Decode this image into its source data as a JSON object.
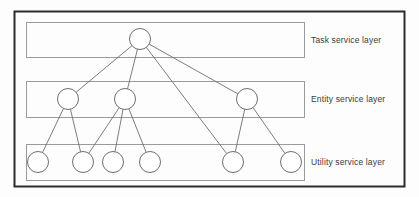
{
  "figure": {
    "background_color": "#fdfdfd",
    "outer_frame_color": "#2b2b2b",
    "layer_box_color": "#9a9a9a",
    "node_stroke_color": "#6e6e6e",
    "node_fill_color": "#ffffff",
    "edge_color": "#6e6e6e",
    "label_color": "#3a3a3a"
  },
  "outer_frame": {
    "x": 14,
    "y": 11,
    "width": 390,
    "height": 175
  },
  "layers": [
    {
      "id": "task",
      "label": "Task service layer",
      "box": {
        "x": 26,
        "y": 22,
        "width": 278,
        "height": 35
      },
      "label_position": {
        "x": 311,
        "y": 36
      },
      "nodes": [
        {
          "id": "t1",
          "cx": 140,
          "cy": 39,
          "r": 10.5
        }
      ]
    },
    {
      "id": "entity",
      "label": "Entity service layer",
      "box": {
        "x": 26,
        "y": 81,
        "width": 278,
        "height": 36
      },
      "label_position": {
        "x": 311,
        "y": 95
      },
      "nodes": [
        {
          "id": "e1",
          "cx": 68,
          "cy": 99,
          "r": 10.5
        },
        {
          "id": "e2",
          "cx": 125,
          "cy": 99,
          "r": 10.5
        },
        {
          "id": "e3",
          "cx": 247,
          "cy": 99,
          "r": 10.5
        }
      ]
    },
    {
      "id": "utility",
      "label": "Utility service layer",
      "box": {
        "x": 26,
        "y": 144,
        "width": 278,
        "height": 36
      },
      "label_position": {
        "x": 311,
        "y": 158
      },
      "nodes": [
        {
          "id": "u1",
          "cx": 38,
          "cy": 162,
          "r": 10.5
        },
        {
          "id": "u2",
          "cx": 83,
          "cy": 162,
          "r": 10.5
        },
        {
          "id": "u3",
          "cx": 113,
          "cy": 162,
          "r": 10.5
        },
        {
          "id": "u4",
          "cx": 150,
          "cy": 162,
          "r": 10.5
        },
        {
          "id": "u5",
          "cx": 233,
          "cy": 162,
          "r": 10.5
        },
        {
          "id": "u6",
          "cx": 291,
          "cy": 162,
          "r": 10.5
        }
      ]
    }
  ],
  "edges": [
    {
      "from": "t1",
      "to": "e1"
    },
    {
      "from": "t1",
      "to": "e2"
    },
    {
      "from": "t1",
      "to": "e3"
    },
    {
      "from": "t1",
      "to": "u5"
    },
    {
      "from": "e1",
      "to": "u1"
    },
    {
      "from": "e1",
      "to": "u2"
    },
    {
      "from": "e2",
      "to": "u2"
    },
    {
      "from": "e2",
      "to": "u3"
    },
    {
      "from": "e2",
      "to": "u4"
    },
    {
      "from": "e3",
      "to": "u5"
    },
    {
      "from": "e3",
      "to": "u6"
    }
  ]
}
